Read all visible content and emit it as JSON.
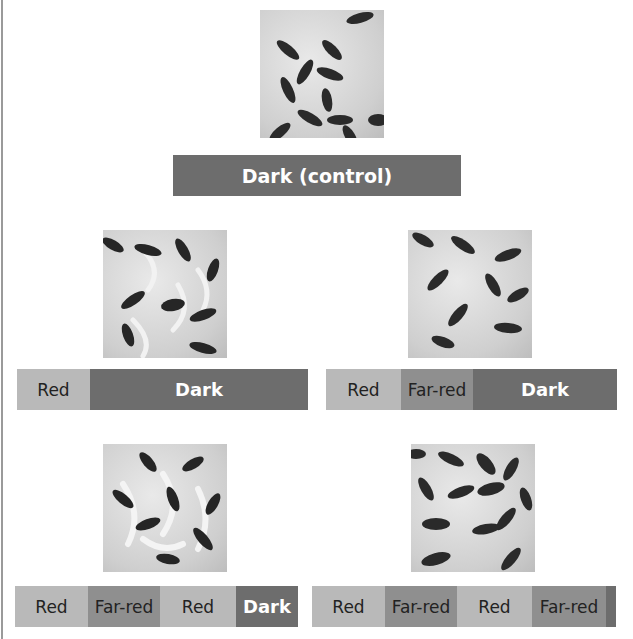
{
  "title_bar": {
    "label": "Dark (control)"
  },
  "colors": {
    "red": "#b9b9b9",
    "far_red": "#8f8f8f",
    "dark": "#6d6d6d",
    "dark_text": "#ffffff",
    "light_text": "#222222"
  },
  "panels": [
    {
      "id": "control",
      "photo": "seeds-not-germinated",
      "segments": [
        {
          "label": "Dark (control)",
          "type": "dark"
        }
      ]
    },
    {
      "id": "r-d",
      "photo": "seeds-germinated",
      "segments": [
        {
          "label": "Red",
          "type": "red"
        },
        {
          "label": "Dark",
          "type": "dark"
        }
      ]
    },
    {
      "id": "r-fr-d",
      "photo": "seeds-not-germinated",
      "segments": [
        {
          "label": "Red",
          "type": "red"
        },
        {
          "label": "Far-red",
          "type": "farred"
        },
        {
          "label": "Dark",
          "type": "dark"
        }
      ]
    },
    {
      "id": "r-fr-r-d",
      "photo": "seeds-germinated",
      "segments": [
        {
          "label": "Red",
          "type": "red"
        },
        {
          "label": "Far-red",
          "type": "farred"
        },
        {
          "label": "Red",
          "type": "red"
        },
        {
          "label": "Dark",
          "type": "dark"
        }
      ]
    },
    {
      "id": "r-fr-r-fr",
      "photo": "seeds-not-germinated",
      "segments": [
        {
          "label": "Red",
          "type": "red"
        },
        {
          "label": "Far-red",
          "type": "farred"
        },
        {
          "label": "Red",
          "type": "red"
        },
        {
          "label": "Far-red",
          "type": "farred"
        },
        {
          "label": "",
          "type": "dark"
        }
      ]
    }
  ]
}
